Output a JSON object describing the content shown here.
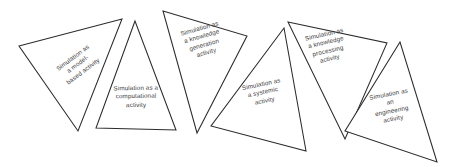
{
  "figure": {
    "background_color": "#ffffff",
    "stroke_color": "#2b2b2b",
    "text_color": "#3a3a3a",
    "triangles": [
      {
        "id": "model-based",
        "label": "Simulation as\na model-\nbased activity",
        "points": "19,46 122,19 78,131"
      },
      {
        "id": "computational",
        "label": "Simulation as a\ncomputational\nactivity",
        "points": "135,21 96,128 176,130"
      },
      {
        "id": "knowledge-generation",
        "label": "Simulation as\na knowledge\ngeneration\nactivity",
        "points": "163,11 247,36 197,133"
      },
      {
        "id": "systemic",
        "label": "Simulation as\na systemic\nactivity",
        "points": "284,28 211,126 306,151"
      },
      {
        "id": "knowledge-processing",
        "label": "Simulation as\na knowledge\nprocessing\nactivity",
        "points": "288,22 387,43 345,139"
      },
      {
        "id": "engineering",
        "label": "Simulation as\nan\nengineering\nactivity",
        "points": "400,42 345,131 437,162"
      }
    ],
    "label_positions": [
      {
        "left": 28,
        "top": 52,
        "width": 100,
        "rotate": -37
      },
      {
        "left": 86,
        "top": 84,
        "width": 100,
        "rotate": -1
      },
      {
        "left": 153,
        "top": 24,
        "width": 100,
        "rotate": -16
      },
      {
        "left": 213,
        "top": 80,
        "width": 100,
        "rotate": -12
      },
      {
        "left": 277,
        "top": 30,
        "width": 100,
        "rotate": -13
      },
      {
        "left": 341,
        "top": 90,
        "width": 100,
        "rotate": -11
      }
    ]
  }
}
